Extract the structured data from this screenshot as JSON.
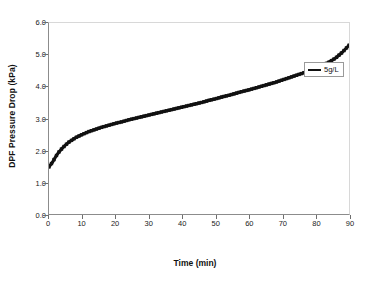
{
  "chart_data": {
    "type": "line",
    "title": "",
    "xlabel": "Time (min)",
    "ylabel": "DPF Pressure Drop (kPa)",
    "xlim": [
      0,
      90
    ],
    "ylim": [
      0.0,
      6.0
    ],
    "xticks": [
      "0",
      "10",
      "20",
      "30",
      "40",
      "50",
      "60",
      "70",
      "80",
      "90"
    ],
    "yticks": [
      "0.0",
      "1.0",
      "2.0",
      "3.0",
      "4.0",
      "5.0",
      "6.0"
    ],
    "grid": false,
    "legend_position": "right-upper",
    "series": [
      {
        "name": "5g/L",
        "color": "#111111",
        "x": [
          0,
          1,
          2,
          3,
          4,
          5,
          6,
          7,
          8,
          9,
          10,
          12,
          14,
          16,
          18,
          20,
          22,
          24,
          26,
          28,
          30,
          32,
          34,
          36,
          38,
          40,
          42,
          44,
          46,
          48,
          50,
          52,
          54,
          56,
          58,
          60,
          62,
          64,
          66,
          68,
          70,
          72,
          74,
          76,
          78,
          80,
          82,
          84,
          86,
          88,
          90
        ],
        "values": [
          1.48,
          1.62,
          1.8,
          1.95,
          2.07,
          2.17,
          2.26,
          2.33,
          2.4,
          2.45,
          2.5,
          2.59,
          2.66,
          2.73,
          2.79,
          2.85,
          2.9,
          2.96,
          3.01,
          3.06,
          3.11,
          3.16,
          3.21,
          3.26,
          3.31,
          3.36,
          3.41,
          3.46,
          3.51,
          3.57,
          3.62,
          3.68,
          3.73,
          3.79,
          3.85,
          3.9,
          3.96,
          4.02,
          4.08,
          4.14,
          4.21,
          4.28,
          4.35,
          4.42,
          4.5,
          4.58,
          4.67,
          4.77,
          4.9,
          5.08,
          5.3
        ]
      }
    ]
  },
  "legend": {
    "entries": [
      {
        "label": "5g/L",
        "color": "#111111"
      }
    ]
  },
  "axes": {
    "x_title": "Time (min)",
    "y_title": "DPF Pressure Drop (kPa)"
  }
}
